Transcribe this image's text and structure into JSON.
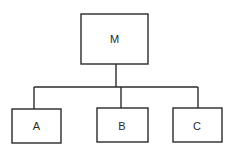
{
  "diagram": {
    "type": "hierarchy-tree",
    "root": {
      "id": "M",
      "label": "M"
    },
    "children": [
      {
        "id": "A",
        "label": "A"
      },
      {
        "id": "B",
        "label": "B"
      },
      {
        "id": "C",
        "label": "C"
      }
    ],
    "edges": [
      {
        "from": "M",
        "to": "A"
      },
      {
        "from": "M",
        "to": "B"
      },
      {
        "from": "M",
        "to": "C"
      }
    ]
  }
}
